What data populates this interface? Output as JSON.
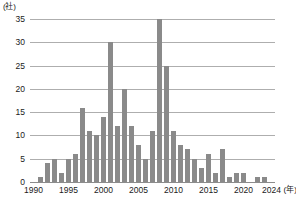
{
  "chart_data": {
    "type": "bar",
    "title": "",
    "xlabel": "年",
    "ylabel": "社",
    "y_unit_label": "(社)",
    "x_unit_label": "(年)",
    "ylim": [
      0,
      35
    ],
    "y_ticks": [
      0,
      5,
      10,
      15,
      20,
      25,
      30,
      35
    ],
    "y_tick_labels": [
      "0",
      "5",
      "10",
      "15",
      "20",
      "25",
      "30",
      "35"
    ],
    "x_ticks": [
      1990,
      1995,
      2000,
      2005,
      2010,
      2015,
      2020,
      2024
    ],
    "x_tick_labels": [
      "1990",
      "1995",
      "2000",
      "2005",
      "2010",
      "2015",
      "2020",
      "2024"
    ],
    "grid": true,
    "grid_axis": "y",
    "legend": false,
    "bar_color": "#8a8a8a",
    "grid_color": "#aeaeae",
    "axis_color": "#8c8c8c",
    "categories": [
      1990,
      1991,
      1992,
      1993,
      1994,
      1995,
      1996,
      1997,
      1998,
      1999,
      2000,
      2001,
      2002,
      2003,
      2004,
      2005,
      2006,
      2007,
      2008,
      2009,
      2010,
      2011,
      2012,
      2013,
      2014,
      2015,
      2016,
      2017,
      2018,
      2019,
      2020,
      2021,
      2022,
      2023,
      2024
    ],
    "values": [
      0,
      1,
      4,
      5,
      2,
      5,
      6,
      16,
      11,
      10,
      14,
      30,
      12,
      20,
      12,
      8,
      5,
      11,
      35,
      25,
      11,
      8,
      7,
      5,
      3,
      6,
      2,
      7,
      1,
      2,
      2,
      0,
      1,
      1,
      0
    ]
  }
}
